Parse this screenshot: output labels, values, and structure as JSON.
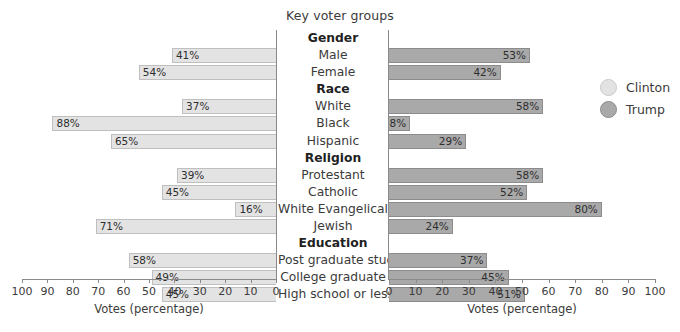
{
  "title": "Key voter groups",
  "axis": {
    "label": "Votes (percentage)",
    "left_ticks": [
      "100",
      "90",
      "80",
      "70",
      "60",
      "50",
      "40",
      "30",
      "20",
      "10",
      "0"
    ],
    "right_ticks": [
      "0",
      "10",
      "20",
      "30",
      "40",
      "50",
      "60",
      "70",
      "80",
      "90",
      "100"
    ]
  },
  "legend": {
    "items": [
      {
        "name": "Clinton",
        "color": "#e3e3e3"
      },
      {
        "name": "Trump",
        "color": "#a9a9a9"
      }
    ]
  },
  "chart_data": {
    "type": "bar",
    "title": "Key voter groups",
    "xlabel": "Votes (percentage)",
    "ylabel": "",
    "xlim": [
      0,
      100
    ],
    "grid": false,
    "legend_position": "right",
    "orientation": "horizontal-diverging",
    "rows": [
      {
        "label": "Gender",
        "header": true
      },
      {
        "label": "Male",
        "header": false,
        "clinton": 41,
        "trump": 53,
        "clinton_text": "41%",
        "trump_text": "53%"
      },
      {
        "label": "Female",
        "header": false,
        "clinton": 54,
        "trump": 42,
        "clinton_text": "54%",
        "trump_text": "42%"
      },
      {
        "label": "Race",
        "header": true
      },
      {
        "label": "White",
        "header": false,
        "clinton": 37,
        "trump": 58,
        "clinton_text": "37%",
        "trump_text": "58%"
      },
      {
        "label": "Black",
        "header": false,
        "clinton": 88,
        "trump": 8,
        "clinton_text": "88%",
        "trump_text": "8%"
      },
      {
        "label": "Hispanic",
        "header": false,
        "clinton": 65,
        "trump": 29,
        "clinton_text": "65%",
        "trump_text": "29%"
      },
      {
        "label": "Religion",
        "header": true
      },
      {
        "label": "Protestant",
        "header": false,
        "clinton": 39,
        "trump": 58,
        "clinton_text": "39%",
        "trump_text": "58%"
      },
      {
        "label": "Catholic",
        "header": false,
        "clinton": 45,
        "trump": 52,
        "clinton_text": "45%",
        "trump_text": "52%"
      },
      {
        "label": "White Evangelical",
        "header": false,
        "clinton": 16,
        "trump": 80,
        "clinton_text": "16%",
        "trump_text": "80%"
      },
      {
        "label": "Jewish",
        "header": false,
        "clinton": 71,
        "trump": 24,
        "clinton_text": "71%",
        "trump_text": "24%"
      },
      {
        "label": "Education",
        "header": true
      },
      {
        "label": "Post graduate study",
        "header": false,
        "clinton": 58,
        "trump": 37,
        "clinton_text": "58%",
        "trump_text": "37%"
      },
      {
        "label": "College graduate",
        "header": false,
        "clinton": 49,
        "trump": 45,
        "clinton_text": "49%",
        "trump_text": "45%"
      },
      {
        "label": "High school or less",
        "header": false,
        "clinton": 45,
        "trump": 51,
        "clinton_text": "45%",
        "trump_text": "51%"
      }
    ],
    "series": [
      {
        "name": "Clinton",
        "color": "#e3e3e3",
        "categories": [
          "Male",
          "Female",
          "White",
          "Black",
          "Hispanic",
          "Protestant",
          "Catholic",
          "White Evangelical",
          "Jewish",
          "Post graduate study",
          "College graduate",
          "High school or less"
        ],
        "values": [
          41,
          54,
          37,
          88,
          65,
          39,
          45,
          16,
          71,
          58,
          49,
          45
        ]
      },
      {
        "name": "Trump",
        "color": "#a9a9a9",
        "categories": [
          "Male",
          "Female",
          "White",
          "Black",
          "Hispanic",
          "Protestant",
          "Catholic",
          "White Evangelical",
          "Jewish",
          "Post graduate study",
          "College graduate",
          "High school or less"
        ],
        "values": [
          53,
          42,
          58,
          8,
          29,
          58,
          52,
          80,
          24,
          37,
          45,
          51
        ]
      }
    ]
  }
}
